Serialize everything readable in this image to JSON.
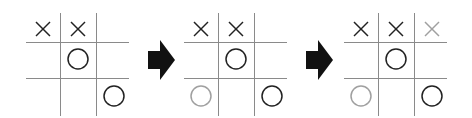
{
  "diagram": {
    "colors": {
      "grid": "#8a8a8a",
      "mark": "#222222",
      "new_mark": "#a0a0a0",
      "arrow": "#111111"
    },
    "boards": [
      {
        "left": 26,
        "cells": [
          [
            "X",
            "X",
            ""
          ],
          [
            "",
            "O",
            ""
          ],
          [
            "",
            "",
            "O"
          ]
        ],
        "highlight": []
      },
      {
        "left": 184,
        "cells": [
          [
            "X",
            "X",
            ""
          ],
          [
            "",
            "O",
            ""
          ],
          [
            "O",
            "",
            "O"
          ]
        ],
        "highlight": [
          [
            2,
            0
          ]
        ]
      },
      {
        "left": 344,
        "cells": [
          [
            "X",
            "X",
            "X"
          ],
          [
            "",
            "O",
            ""
          ],
          [
            "O",
            "",
            "O"
          ]
        ],
        "highlight": [
          [
            0,
            2
          ],
          [
            2,
            0
          ]
        ]
      }
    ],
    "arrows": [
      {
        "left": 148
      },
      {
        "left": 306
      }
    ]
  }
}
